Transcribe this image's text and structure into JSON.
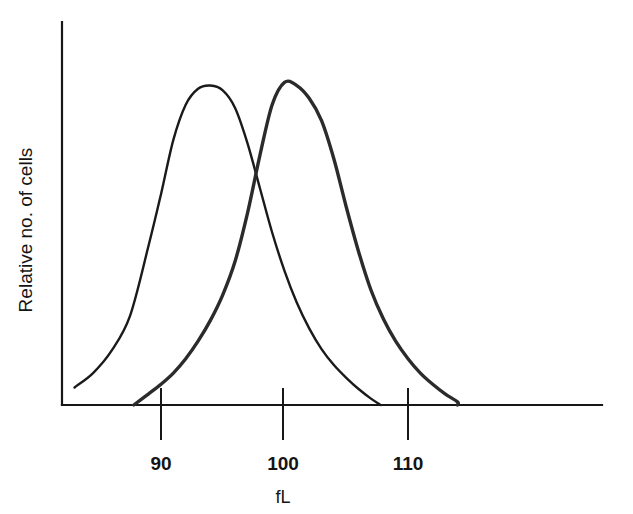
{
  "chart_data": {
    "type": "line",
    "title": "",
    "subtitle": "",
    "xlabel": "fL",
    "ylabel": "Relative no. of cells",
    "xlim": [
      83,
      127
    ],
    "ylim": [
      0,
      1.08
    ],
    "x_ticks": [
      90,
      100,
      110
    ],
    "x_tick_labels": [
      "90",
      "100",
      "110"
    ],
    "y_ticks": [],
    "y_tick_labels": [],
    "grid": false,
    "legend": "none",
    "annotations": [],
    "series": [
      {
        "name": "curve-left",
        "color": "#1a1a1a",
        "line_width": 2.4,
        "peak_x": 94,
        "peak_y": 1.0,
        "x": [
          83.0,
          84.5,
          86.0,
          87.5,
          89.0,
          90.0,
          91.0,
          92.0,
          93.0,
          94.0,
          95.0,
          96.0,
          97.0,
          98.0,
          99.0,
          100.0,
          101.0,
          102.0,
          103.0,
          104.0,
          105.0,
          106.0,
          107.0,
          107.8
        ],
        "y": [
          0.055,
          0.1,
          0.17,
          0.28,
          0.5,
          0.66,
          0.83,
          0.94,
          0.99,
          1.0,
          0.985,
          0.93,
          0.82,
          0.68,
          0.54,
          0.42,
          0.32,
          0.24,
          0.175,
          0.125,
          0.085,
          0.05,
          0.02,
          0.0
        ]
      },
      {
        "name": "curve-right",
        "color": "#2b2b2b",
        "line_width": 3.4,
        "peak_x": 100,
        "peak_y": 1.01,
        "x": [
          87.8,
          89.0,
          90.0,
          91.0,
          92.0,
          93.0,
          94.0,
          95.0,
          96.0,
          97.0,
          98.0,
          99.0,
          100.0,
          101.0,
          102.0,
          103.0,
          104.0,
          105.0,
          106.0,
          107.0,
          108.0,
          109.0,
          110.0,
          111.0,
          112.0,
          113.0,
          114.0,
          114.0
        ],
        "y": [
          0.0,
          0.035,
          0.065,
          0.1,
          0.145,
          0.2,
          0.265,
          0.345,
          0.45,
          0.6,
          0.78,
          0.94,
          1.01,
          1.0,
          0.96,
          0.89,
          0.77,
          0.62,
          0.48,
          0.36,
          0.27,
          0.2,
          0.145,
          0.1,
          0.065,
          0.035,
          0.01,
          0.0
        ]
      }
    ]
  },
  "figure": {
    "background_color": "#ffffff",
    "axis_color": "#171717",
    "text_color": "#141414"
  }
}
